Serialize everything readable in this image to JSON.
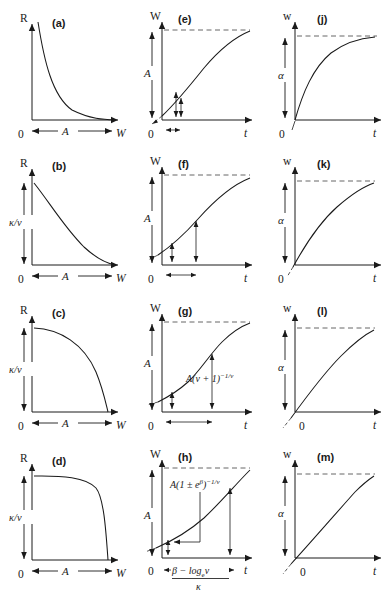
{
  "figure": {
    "background": "#ffffff",
    "ink": "#1a1a1a",
    "dash_color": "#555555",
    "columns": 3,
    "rows": 4
  },
  "symbols": {
    "R": "R",
    "W_upper": "W",
    "w_lower": "w",
    "t": "t",
    "A": "A",
    "alpha": "α",
    "zero": "0",
    "kappa_over_nu": "κ/ν",
    "kappa": "κ",
    "nu": "ν",
    "beta": "β",
    "log_base": "e",
    "log": "log",
    "minus": "−",
    "plusminus": "±"
  },
  "panels": [
    {
      "id": "a",
      "label": "(a)",
      "column": 1,
      "row": 1,
      "xlabel": "W",
      "ylabel": "R",
      "origin_label": "0",
      "y_dim_label": "",
      "x_dim_label": "A",
      "curve_type": "decaying-convex",
      "has_dashed_asymptote": false,
      "note": "R falls steeply from high value, convex decay to zero at W = A"
    },
    {
      "id": "b",
      "label": "(b)",
      "column": 1,
      "row": 2,
      "xlabel": "W",
      "ylabel": "R",
      "origin_label": "0",
      "y_dim_label": "κ/ν",
      "x_dim_label": "A",
      "curve_type": "convex-decay-finite-intercept",
      "has_dashed_asymptote": false,
      "note": "R starts at κ/ν and decays convexly to zero at W = A"
    },
    {
      "id": "c",
      "label": "(c)",
      "column": 1,
      "row": 3,
      "xlabel": "W",
      "ylabel": "R",
      "origin_label": "0",
      "y_dim_label": "κ/ν",
      "x_dim_label": "A",
      "curve_type": "quarter-ellipse-decay",
      "has_dashed_asymptote": false,
      "note": "R flat-topped at κ/ν then drops like a quarter ellipse to zero at W = A"
    },
    {
      "id": "d",
      "label": "(d)",
      "column": 1,
      "row": 4,
      "xlabel": "W",
      "ylabel": "R",
      "origin_label": "0",
      "y_dim_label": "κ/ν",
      "x_dim_label": "A",
      "curve_type": "plateau-then-steep-drop",
      "has_dashed_asymptote": false,
      "note": "R holds at κ/ν across most of range then plunges to zero at W = A"
    },
    {
      "id": "e",
      "label": "(e)",
      "column": 2,
      "row": 1,
      "xlabel": "t",
      "ylabel": "W",
      "origin_label": "0",
      "y_dim_label": "A",
      "curve_type": "monomolecular-saturating",
      "has_dashed_asymptote": true,
      "asymptote_label": "A",
      "annotations": [],
      "markers": [
        "inflection-arrow-near-origin",
        "small-horizontal-double-arrow"
      ],
      "note": "Saturating curve approaching asymptote A; tangent extended back below origin"
    },
    {
      "id": "f",
      "label": "(f)",
      "column": 2,
      "row": 2,
      "xlabel": "t",
      "ylabel": "W",
      "origin_label": "0",
      "y_dim_label": "A",
      "curve_type": "gentle-sigmoid",
      "has_dashed_asymptote": true,
      "asymptote_label": "A",
      "annotations": [],
      "markers": [
        "inflection-arrow",
        "horizontal-double-arrow"
      ],
      "note": "Weakly sigmoid curve with inflection marked and time-to-inflection bracket"
    },
    {
      "id": "g",
      "label": "(g)",
      "column": 2,
      "row": 3,
      "xlabel": "t",
      "ylabel": "W",
      "origin_label": "0",
      "y_dim_label": "A",
      "curve_type": "sigmoid",
      "has_dashed_asymptote": true,
      "asymptote_label": "A",
      "annotations": [
        {
          "text": "A(ν + 1)",
          "superscript": "−1/ν",
          "kind": "inflection-height"
        }
      ],
      "markers": [
        "inflection-arrow",
        "horizontal-double-arrow"
      ],
      "note": "Sigmoid with inflection ordinate labelled A(ν + 1)^(−1/ν)"
    },
    {
      "id": "h",
      "label": "(h)",
      "column": 2,
      "row": 4,
      "xlabel": "t",
      "ylabel": "W",
      "origin_label": "0",
      "y_dim_label": "A",
      "curve_type": "exponential-rising",
      "has_dashed_asymptote": true,
      "asymptote_label": "A",
      "annotations": [
        {
          "text": "A(1 ± e",
          "superscript_1": "β",
          "text_2": ")",
          "superscript_2": "−1/ν",
          "kind": "initial-value"
        },
        {
          "numerator": "β − log",
          "numerator_sub": "e",
          "numerator_tail": "ν",
          "denominator": "κ",
          "kind": "time-bracket"
        }
      ],
      "markers": [
        "value-arrow-at-origin",
        "right-value-arrow",
        "horizontal-double-arrow"
      ],
      "note": "Rising convex curve; intercept A(1 ± e^β)^(−1/ν); abscissa span (β − log_e ν)/κ"
    },
    {
      "id": "j",
      "label": "(j)",
      "column": 3,
      "row": 1,
      "xlabel": "t",
      "ylabel": "w",
      "origin_label": "0",
      "y_dim_label": "α",
      "curve_type": "monomolecular-saturating",
      "has_dashed_asymptote": true,
      "asymptote_label": "α",
      "note": "Saturating curve from origin rising steeply to asymptote α"
    },
    {
      "id": "k",
      "label": "(k)",
      "column": 3,
      "row": 2,
      "xlabel": "t",
      "ylabel": "w",
      "origin_label": "0",
      "y_dim_label": "α",
      "curve_type": "saturating-moderate",
      "has_dashed_asymptote": true,
      "asymptote_label": "α",
      "note": "Less sharply saturating curve approaching α, tangent extended below origin"
    },
    {
      "id": "l",
      "label": "(l)",
      "column": 3,
      "row": 3,
      "xlabel": "t",
      "ylabel": "w",
      "origin_label": "0",
      "y_dim_label": "α",
      "curve_type": "near-linear-saturating",
      "has_dashed_asymptote": true,
      "asymptote_label": "α",
      "note": "Gently bending curve toward α with back-extended tangent"
    },
    {
      "id": "m",
      "label": "(m)",
      "column": 3,
      "row": 4,
      "xlabel": "t",
      "ylabel": "w",
      "origin_label": "0",
      "y_dim_label": "α",
      "curve_type": "almost-linear",
      "has_dashed_asymptote": true,
      "asymptote_label": "α",
      "note": "Nearly straight rise only slightly bending below asymptote α"
    }
  ]
}
